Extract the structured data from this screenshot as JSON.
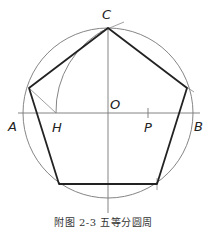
{
  "figure": {
    "caption": "附图 2-3   五等分圆周",
    "labels": {
      "C": "C",
      "O": "O",
      "A": "A",
      "H": "H",
      "P": "P",
      "B": "B"
    }
  },
  "geometry": {
    "center": [
      108,
      113
    ],
    "radius": 85,
    "pentagon_vertices": [
      [
        108,
        28
      ],
      [
        187,
        88
      ],
      [
        157,
        184
      ],
      [
        59,
        184
      ],
      [
        29,
        88
      ]
    ],
    "arc_center": [
      108,
      113
    ],
    "H": [
      56,
      113
    ],
    "P": [
      148,
      113
    ]
  },
  "colors": {
    "thin_line": "#777777",
    "thick_line": "#222222"
  }
}
